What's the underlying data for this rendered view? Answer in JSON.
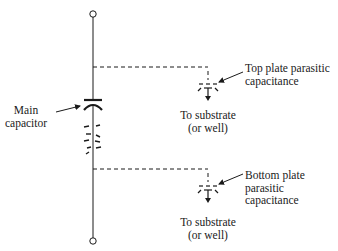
{
  "diagram": {
    "type": "circuit-schematic",
    "colors": {
      "ink": "#1a1a1a",
      "background": "#ffffff"
    },
    "main_capacitor": {
      "label_line1": "Main",
      "label_line2": "capacitor"
    },
    "top_parasitic": {
      "label_line1": "Top plate parasitic",
      "label_line2": "capacitance",
      "to_line1": "To substrate",
      "to_line2": "(or well)"
    },
    "bottom_parasitic": {
      "label_line1": "Bottom plate",
      "label_line2": "parasitic",
      "label_line3": "capacitance",
      "to_line1": "To substrate",
      "to_line2": "(or well)"
    }
  }
}
